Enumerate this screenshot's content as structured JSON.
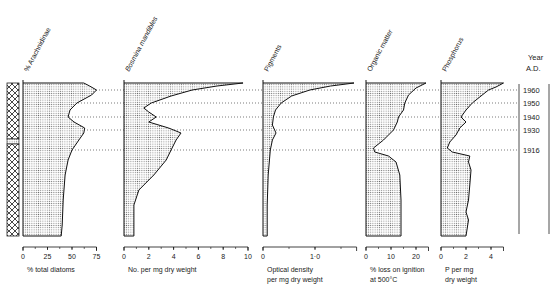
{
  "figure": {
    "year_axis": {
      "title_line1": "Year",
      "title_line2": "A.D.",
      "years": [
        {
          "label": "1960",
          "y": 90
        },
        {
          "label": "1950",
          "y": 103
        },
        {
          "label": "1940",
          "y": 117
        },
        {
          "label": "1930",
          "y": 130
        },
        {
          "label": "1916",
          "y": 150
        }
      ]
    },
    "panels": [
      {
        "id": "arachnidinae",
        "title": "% Arachnidinae",
        "xlabel_line1": "% total diatoms",
        "xlabel_line2": "",
        "x0": 23,
        "px_per_unit": 0.98,
        "ticks": [
          {
            "v": 0,
            "label": "0"
          },
          {
            "v": 25,
            "label": "25"
          },
          {
            "v": 50,
            "label": "50"
          },
          {
            "v": 75,
            "label": "75"
          }
        ],
        "axis_max": 75
      },
      {
        "id": "bosmina",
        "title": "Bosmina mandibles",
        "xlabel_line1": "No. per mg dry weight",
        "xlabel_line2": "",
        "x0": 124,
        "px_per_unit": 12.4,
        "ticks": [
          {
            "v": 0,
            "label": "0"
          },
          {
            "v": 2,
            "label": "2"
          },
          {
            "v": 4,
            "label": "4"
          },
          {
            "v": 6,
            "label": "6"
          },
          {
            "v": 8,
            "label": "8"
          },
          {
            "v": 10,
            "label": "10"
          }
        ],
        "axis_max": 10
      },
      {
        "id": "pigments",
        "title": "Pigments",
        "xlabel_line1": "Optical density",
        "xlabel_line2": "per mg dry weight",
        "x0": 263,
        "px_per_unit": 52,
        "ticks": [
          {
            "v": 0,
            "label": "0"
          },
          {
            "v": 1.0,
            "label": "1·0"
          }
        ],
        "axis_max": 1.8
      },
      {
        "id": "organic",
        "title": "Organic matter",
        "xlabel_line1": "% loss on ignition",
        "xlabel_line2": "at 500°C",
        "x0": 366,
        "px_per_unit": 2.5,
        "ticks": [
          {
            "v": 0,
            "label": "0"
          },
          {
            "v": 10,
            "label": "10"
          },
          {
            "v": 20,
            "label": "20"
          }
        ],
        "axis_max": 25
      },
      {
        "id": "phosphorus",
        "title": "Phosphorus",
        "xlabel_line1": "P per mg",
        "xlabel_line2": "dry weight",
        "x0": 441,
        "px_per_unit": 12.5,
        "ticks": [
          {
            "v": 0,
            "label": "0"
          },
          {
            "v": 2,
            "label": "2"
          },
          {
            "v": 4,
            "label": "4"
          }
        ],
        "axis_max": 5
      }
    ]
  },
  "chart_data": {
    "type": "area",
    "ylabel": "Year A.D. (depth)",
    "y_tick_labels": [
      "1960",
      "1950",
      "1940",
      "1930",
      "1916"
    ],
    "legend": [],
    "series": [
      {
        "name": "% Arachnidinae",
        "unit": "% total diatoms",
        "xlim": [
          0,
          75
        ],
        "points": [
          {
            "y": 83,
            "v": 62
          },
          {
            "y": 86,
            "v": 68
          },
          {
            "y": 90,
            "v": 75
          },
          {
            "y": 95,
            "v": 70
          },
          {
            "y": 103,
            "v": 55
          },
          {
            "y": 110,
            "v": 48
          },
          {
            "y": 117,
            "v": 46
          },
          {
            "y": 122,
            "v": 52
          },
          {
            "y": 128,
            "v": 63
          },
          {
            "y": 133,
            "v": 62
          },
          {
            "y": 140,
            "v": 57
          },
          {
            "y": 150,
            "v": 50
          },
          {
            "y": 160,
            "v": 46
          },
          {
            "y": 175,
            "v": 43
          },
          {
            "y": 200,
            "v": 41
          },
          {
            "y": 225,
            "v": 40
          },
          {
            "y": 236,
            "v": 39
          }
        ]
      },
      {
        "name": "Bosmina mandibles",
        "unit": "No. per mg dry weight",
        "xlim": [
          0,
          10
        ],
        "points": [
          {
            "y": 83,
            "v": 9.6
          },
          {
            "y": 86,
            "v": 7.5
          },
          {
            "y": 90,
            "v": 5.5
          },
          {
            "y": 96,
            "v": 3.8
          },
          {
            "y": 103,
            "v": 2.2
          },
          {
            "y": 108,
            "v": 1.6
          },
          {
            "y": 112,
            "v": 2.0
          },
          {
            "y": 117,
            "v": 2.6
          },
          {
            "y": 122,
            "v": 2.0
          },
          {
            "y": 128,
            "v": 3.6
          },
          {
            "y": 133,
            "v": 4.6
          },
          {
            "y": 140,
            "v": 4.2
          },
          {
            "y": 150,
            "v": 3.8
          },
          {
            "y": 160,
            "v": 3.4
          },
          {
            "y": 175,
            "v": 2.4
          },
          {
            "y": 190,
            "v": 1.2
          },
          {
            "y": 205,
            "v": 0.8
          },
          {
            "y": 236,
            "v": 0.8
          }
        ]
      },
      {
        "name": "Pigments",
        "unit": "Optical density per mg dry weight",
        "xlim": [
          0,
          1.8
        ],
        "points": [
          {
            "y": 83,
            "v": 1.75
          },
          {
            "y": 86,
            "v": 1.3
          },
          {
            "y": 90,
            "v": 0.9
          },
          {
            "y": 96,
            "v": 0.55
          },
          {
            "y": 103,
            "v": 0.35
          },
          {
            "y": 110,
            "v": 0.24
          },
          {
            "y": 117,
            "v": 0.2
          },
          {
            "y": 125,
            "v": 0.18
          },
          {
            "y": 133,
            "v": 0.25
          },
          {
            "y": 140,
            "v": 0.18
          },
          {
            "y": 150,
            "v": 0.14
          },
          {
            "y": 175,
            "v": 0.1
          },
          {
            "y": 205,
            "v": 0.08
          },
          {
            "y": 236,
            "v": 0.08
          }
        ]
      },
      {
        "name": "Organic matter",
        "unit": "% loss on ignition at 500°C",
        "xlim": [
          0,
          25
        ],
        "points": [
          {
            "y": 83,
            "v": 24
          },
          {
            "y": 88,
            "v": 20
          },
          {
            "y": 95,
            "v": 17
          },
          {
            "y": 103,
            "v": 15.5
          },
          {
            "y": 110,
            "v": 15
          },
          {
            "y": 117,
            "v": 13
          },
          {
            "y": 122,
            "v": 12.5
          },
          {
            "y": 130,
            "v": 11
          },
          {
            "y": 140,
            "v": 7
          },
          {
            "y": 148,
            "v": 3
          },
          {
            "y": 152,
            "v": 3.5
          },
          {
            "y": 156,
            "v": 9
          },
          {
            "y": 162,
            "v": 12
          },
          {
            "y": 175,
            "v": 13.5
          },
          {
            "y": 200,
            "v": 14
          },
          {
            "y": 236,
            "v": 14
          }
        ]
      },
      {
        "name": "Phosphorus",
        "unit": "P per mg dry weight",
        "xlim": [
          0,
          5
        ],
        "points": [
          {
            "y": 83,
            "v": 5.0
          },
          {
            "y": 87,
            "v": 4.4
          },
          {
            "y": 90,
            "v": 3.8
          },
          {
            "y": 96,
            "v": 3.2
          },
          {
            "y": 103,
            "v": 2.5
          },
          {
            "y": 110,
            "v": 2.0
          },
          {
            "y": 117,
            "v": 1.6
          },
          {
            "y": 122,
            "v": 2.0
          },
          {
            "y": 128,
            "v": 1.5
          },
          {
            "y": 135,
            "v": 1.2
          },
          {
            "y": 142,
            "v": 0.7
          },
          {
            "y": 148,
            "v": 0.5
          },
          {
            "y": 152,
            "v": 0.9
          },
          {
            "y": 156,
            "v": 2.3
          },
          {
            "y": 162,
            "v": 2.2
          },
          {
            "y": 170,
            "v": 2.4
          },
          {
            "y": 185,
            "v": 2.3
          },
          {
            "y": 200,
            "v": 2.2
          },
          {
            "y": 212,
            "v": 2.0
          },
          {
            "y": 220,
            "v": 2.2
          },
          {
            "y": 236,
            "v": 2.0
          }
        ]
      }
    ],
    "grid": false,
    "reference_lines": [
      "1960",
      "1950",
      "1940",
      "1930",
      "1916"
    ]
  }
}
